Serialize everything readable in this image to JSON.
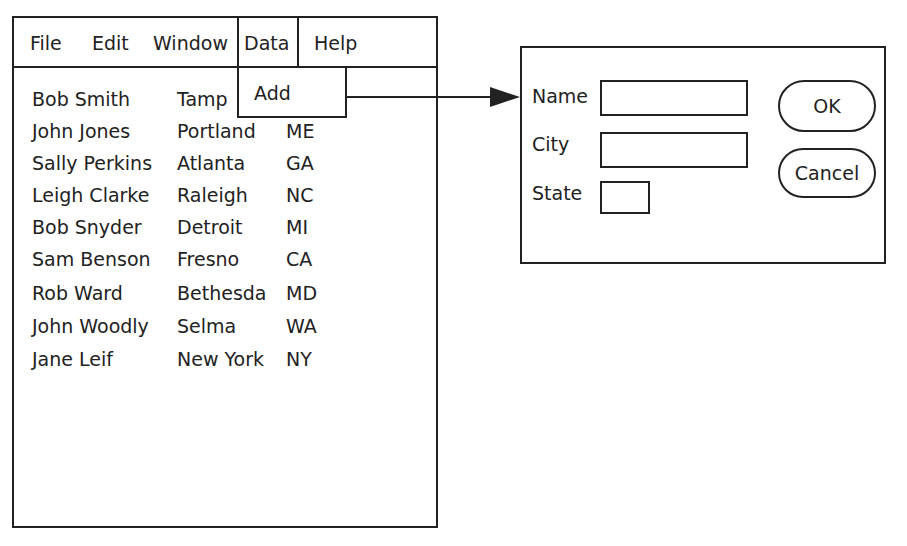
{
  "menubar": {
    "items": [
      "File",
      "Edit",
      "Window",
      "Data",
      "Help"
    ],
    "active": "Data"
  },
  "dropdown": {
    "items": [
      "Add"
    ]
  },
  "records": [
    {
      "name": "Bob Smith",
      "city": "Tamp",
      "state": ""
    },
    {
      "name": "John Jones",
      "city": "Portland",
      "state": "ME"
    },
    {
      "name": "Sally Perkins",
      "city": "Atlanta",
      "state": "GA"
    },
    {
      "name": "Leigh Clarke",
      "city": "Raleigh",
      "state": "NC"
    },
    {
      "name": "Bob Snyder",
      "city": "Detroit",
      "state": "MI"
    },
    {
      "name": "Sam Benson",
      "city": "Fresno",
      "state": "CA"
    },
    {
      "name": "Rob Ward",
      "city": "Bethesda",
      "state": "MD"
    },
    {
      "name": "John Woodly",
      "city": "Selma",
      "state": "WA"
    },
    {
      "name": "Jane Leif",
      "city": "New York",
      "state": "NY"
    }
  ],
  "dialog": {
    "fields": [
      {
        "label": "Name",
        "value": ""
      },
      {
        "label": "City",
        "value": ""
      },
      {
        "label": "State",
        "value": ""
      }
    ],
    "ok_label": "OK",
    "cancel_label": "Cancel"
  }
}
